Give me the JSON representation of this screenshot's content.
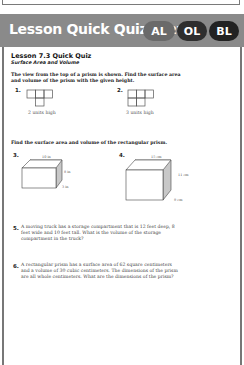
{
  "header": {
    "title": "Lesson Quick Quiz",
    "page_ref": "(p. 27)",
    "badges": [
      {
        "label": "AL",
        "color": "#6a6a6a"
      },
      {
        "label": "OL",
        "color": "#2e2e2e"
      },
      {
        "label": "BL",
        "color": "#222222"
      }
    ]
  },
  "quiz": {
    "title": "Lesson 7.3 Quick Quiz",
    "subtitle": "Surface Area and Volume",
    "section1_instructions": "The view from the top of a prism is shown. Find the surface area and volume of the prism with the given height.",
    "problems_top_view": [
      {
        "number": "1.",
        "caption": "2 units high"
      },
      {
        "number": "2.",
        "caption": "3 units high"
      }
    ],
    "section2_instructions": "Find the surface area and volume of the rectangular prism.",
    "problems_prism": [
      {
        "number": "3.",
        "length": "10 in",
        "height": "8 in",
        "depth": "3 in"
      },
      {
        "number": "4.",
        "length": "15 cm",
        "height": "11 cm",
        "depth": "9 cm"
      }
    ],
    "word_problems": [
      {
        "number": "5.",
        "text": "A moving truck has a storage compartment that is 12 feet deep, 8 feet wide and 10 feet tall. What is the volume of the storage compartment in the truck?"
      },
      {
        "number": "6.",
        "text": "A rectangular prism has a surface area of 62 square centimeters and a volume of 30 cubic centimeters. The dimensions of the prism are all whole centimeters. What are the dimensions of the prism?"
      }
    ]
  }
}
